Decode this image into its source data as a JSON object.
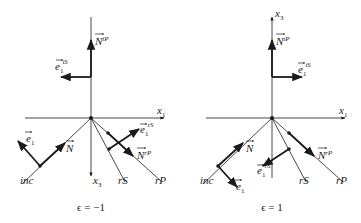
{
  "panels": [
    {
      "caption": "ϵ = −1",
      "labels": {
        "x1": "x",
        "x1_sub": "1",
        "x3": "x",
        "x3_sub": "3",
        "N_iP": "N",
        "N_iP_sup": "iP",
        "e1_iS": "e",
        "e1_iS_sub": "1",
        "e1_iS_sup": "iS",
        "e1": "e",
        "e1_sub": "1",
        "N": "N",
        "e1_rS": "e",
        "e1_rS_sub": "1",
        "e1_rS_sup": "rS",
        "N_rP": "N",
        "N_rP_sup": "rP",
        "inc": "inc",
        "rS": "rS",
        "rP": "rP"
      }
    },
    {
      "caption": "ϵ = 1",
      "labels": {
        "x1": "x",
        "x1_sub": "1",
        "x3": "x",
        "x3_sub": "3",
        "N_iP": "N",
        "N_iP_sup": "iP",
        "e1_iS": "e",
        "e1_iS_sub": "1",
        "e1_iS_sup": "iS",
        "e1": "e",
        "e1_sub": "1",
        "N": "N",
        "e1_rS": "e",
        "e1_rS_sub": "1",
        "e1_rS_sup": "rS",
        "N_rP": "N",
        "N_rP_sup": "rP",
        "inc": "inc",
        "rS": "rS",
        "rP": "rP"
      }
    }
  ]
}
